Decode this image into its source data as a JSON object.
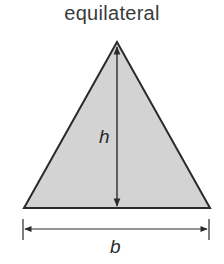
{
  "diagram": {
    "title": "equilateral",
    "shape": "triangle",
    "labels": {
      "height": "h",
      "base": "b"
    },
    "colors": {
      "fill": "#d3d3d3",
      "stroke": "#2a2a2a",
      "text": "#3a3a3a"
    }
  }
}
